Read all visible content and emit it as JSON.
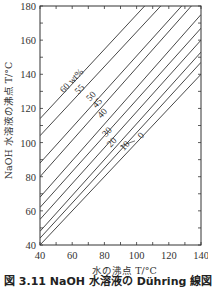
{
  "chart_data": {
    "type": "line",
    "title": "",
    "xlabel": "水の沸点 T/°C",
    "ylabel": "NaOH 水溶液の沸点 T/°C",
    "xlim": [
      40,
      140
    ],
    "ylim": [
      40,
      180
    ],
    "x_ticks": [
      40,
      60,
      80,
      100,
      120,
      140
    ],
    "y_ticks": [
      40,
      60,
      80,
      100,
      120,
      140,
      160,
      180
    ],
    "x_minor_step": 10,
    "y_minor_step": 10,
    "grid": false,
    "legend": "inline labels on lines",
    "series": [
      {
        "name": "60 wt%",
        "label": "60 wt%",
        "x": [
          40,
          105
        ],
        "y": [
          114,
          180
        ]
      },
      {
        "name": "55",
        "label": "55",
        "x": [
          40,
          115
        ],
        "y": [
          104,
          180
        ]
      },
      {
        "name": "50",
        "label": "50",
        "x": [
          40,
          128
        ],
        "y": [
          88,
          180
        ]
      },
      {
        "name": "45",
        "label": "45",
        "x": [
          40,
          134
        ],
        "y": [
          80,
          180
        ]
      },
      {
        "name": "40",
        "label": "40",
        "x": [
          40,
          140
        ],
        "y": [
          68,
          175
        ]
      },
      {
        "name": "35",
        "label": "",
        "x": [
          40,
          140
        ],
        "y": [
          62,
          167
        ]
      },
      {
        "name": "30",
        "label": "30",
        "x": [
          40,
          140
        ],
        "y": [
          55,
          160
        ]
      },
      {
        "name": "20",
        "label": "20",
        "x": [
          40,
          140
        ],
        "y": [
          48,
          153
        ]
      },
      {
        "name": "10",
        "label": "10",
        "x": [
          40,
          140
        ],
        "y": [
          44,
          147
        ]
      },
      {
        "name": "0",
        "label": "0",
        "x": [
          40,
          140
        ],
        "y": [
          40,
          140
        ]
      }
    ]
  },
  "caption": "図 3.11  NaOH 水溶液の Dühring 線図"
}
